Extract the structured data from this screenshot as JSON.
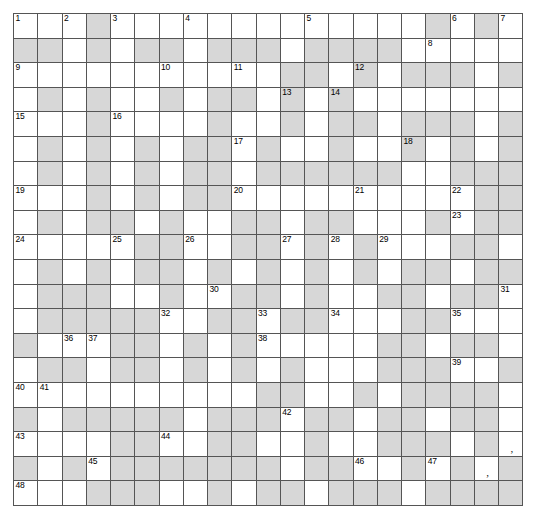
{
  "puzzle": {
    "kind": "crossword-grid",
    "rows": 20,
    "cols": 21,
    "cell_colors": {
      "open": "#ffffff",
      "block": "#d7d7d7",
      "border": "#555555",
      "number": "#000000",
      "page_background": "#ffffff"
    },
    "numbers": [
      {
        "n": "1",
        "row": 1,
        "col": 1
      },
      {
        "n": "2",
        "row": 1,
        "col": 3
      },
      {
        "n": "3",
        "row": 1,
        "col": 5
      },
      {
        "n": "4",
        "row": 1,
        "col": 8
      },
      {
        "n": "5",
        "row": 1,
        "col": 13
      },
      {
        "n": "6",
        "row": 1,
        "col": 19
      },
      {
        "n": "7",
        "row": 1,
        "col": 21
      },
      {
        "n": "8",
        "row": 2,
        "col": 18
      },
      {
        "n": "9",
        "row": 3,
        "col": 1
      },
      {
        "n": "10",
        "row": 3,
        "col": 7
      },
      {
        "n": "11",
        "row": 3,
        "col": 10
      },
      {
        "n": "12",
        "row": 3,
        "col": 15
      },
      {
        "n": "13",
        "row": 4,
        "col": 12
      },
      {
        "n": "14",
        "row": 4,
        "col": 14
      },
      {
        "n": "15",
        "row": 5,
        "col": 1
      },
      {
        "n": "16",
        "row": 5,
        "col": 5
      },
      {
        "n": "17",
        "row": 6,
        "col": 10
      },
      {
        "n": "18",
        "row": 6,
        "col": 17
      },
      {
        "n": "19",
        "row": 8,
        "col": 1
      },
      {
        "n": "20",
        "row": 8,
        "col": 10
      },
      {
        "n": "21",
        "row": 8,
        "col": 15
      },
      {
        "n": "22",
        "row": 8,
        "col": 19
      },
      {
        "n": "23",
        "row": 9,
        "col": 19
      },
      {
        "n": "24",
        "row": 10,
        "col": 1
      },
      {
        "n": "25",
        "row": 10,
        "col": 5
      },
      {
        "n": "26",
        "row": 10,
        "col": 8
      },
      {
        "n": "27",
        "row": 10,
        "col": 12
      },
      {
        "n": "28",
        "row": 10,
        "col": 14
      },
      {
        "n": "29",
        "row": 10,
        "col": 16
      },
      {
        "n": "30",
        "row": 12,
        "col": 9
      },
      {
        "n": "31",
        "row": 12,
        "col": 21
      },
      {
        "n": "32",
        "row": 13,
        "col": 7
      },
      {
        "n": "33",
        "row": 13,
        "col": 11
      },
      {
        "n": "34",
        "row": 13,
        "col": 14
      },
      {
        "n": "35",
        "row": 13,
        "col": 19
      },
      {
        "n": "36",
        "row": 14,
        "col": 3
      },
      {
        "n": "37",
        "row": 14,
        "col": 4
      },
      {
        "n": "38",
        "row": 14,
        "col": 11
      },
      {
        "n": "39",
        "row": 15,
        "col": 19
      },
      {
        "n": "40",
        "row": 16,
        "col": 1
      },
      {
        "n": "41",
        "row": 16,
        "col": 2
      },
      {
        "n": "42",
        "row": 17,
        "col": 12
      },
      {
        "n": "43",
        "row": 18,
        "col": 1
      },
      {
        "n": "44",
        "row": 18,
        "col": 7
      },
      {
        "n": "45",
        "row": 19,
        "col": 4
      },
      {
        "n": "46",
        "row": 19,
        "col": 15
      },
      {
        "n": "47",
        "row": 19,
        "col": 18
      },
      {
        "n": "48",
        "row": 20,
        "col": 1
      },
      {
        "n": "49",
        "row": 21,
        "col": 11
      },
      {
        "n": "50",
        "row": 21,
        "col": 18
      }
    ],
    "punctuation": [
      {
        "mark": ",",
        "row": 18,
        "col": 21
      },
      {
        "mark": ",",
        "row": 19,
        "col": 20
      }
    ],
    "blocks": [
      [
        4,
        18,
        20
      ],
      [
        1,
        2,
        4,
        6,
        7,
        9,
        10,
        11,
        13,
        14,
        15,
        16
      ],
      [
        12,
        13,
        15,
        17,
        18,
        19,
        21
      ],
      [
        2,
        4,
        7,
        9,
        10,
        12,
        14
      ],
      [
        4,
        9,
        12,
        14,
        15,
        17,
        18,
        19,
        21
      ],
      [
        2,
        4,
        6,
        8,
        9,
        11,
        14,
        17,
        19,
        21
      ],
      [
        2,
        4,
        6,
        8,
        9,
        11,
        12,
        13,
        14,
        15,
        16,
        19,
        20,
        21
      ],
      [
        4,
        6,
        8,
        9,
        20,
        21
      ],
      [
        2,
        4,
        5,
        7,
        10,
        11,
        13,
        14,
        18,
        20,
        21
      ],
      [
        6,
        7,
        10,
        11,
        13,
        15,
        19,
        20
      ],
      [
        2,
        4,
        6,
        7,
        9,
        11,
        13,
        15,
        17,
        18,
        20,
        21
      ],
      [
        2,
        3,
        4,
        7,
        10,
        11,
        13,
        16,
        17,
        19,
        20
      ],
      [
        2,
        3,
        4,
        5,
        6,
        9,
        10,
        12,
        13,
        17,
        18
      ],
      [
        1,
        5,
        6,
        8,
        10,
        16,
        17,
        19,
        20
      ],
      [
        2,
        3,
        5,
        6,
        8,
        10,
        12,
        16,
        17,
        18,
        21
      ],
      [
        11,
        12,
        15,
        17,
        18,
        19,
        20
      ],
      [
        1,
        3,
        4,
        5,
        6,
        7,
        9,
        10,
        11,
        13,
        14,
        16,
        17,
        19,
        20
      ],
      [
        5,
        6,
        9,
        10,
        13,
        16,
        17,
        18,
        20
      ],
      [
        1,
        3,
        5,
        6,
        7,
        8,
        9,
        10,
        11,
        13,
        14,
        17,
        19,
        21
      ],
      [
        4,
        5,
        6,
        9,
        11,
        12,
        14,
        15,
        16,
        18,
        19,
        20,
        21
      ],
      [
        1,
        3,
        4,
        5,
        6,
        8,
        9,
        10,
        14,
        16,
        17,
        21
      ]
    ]
  }
}
